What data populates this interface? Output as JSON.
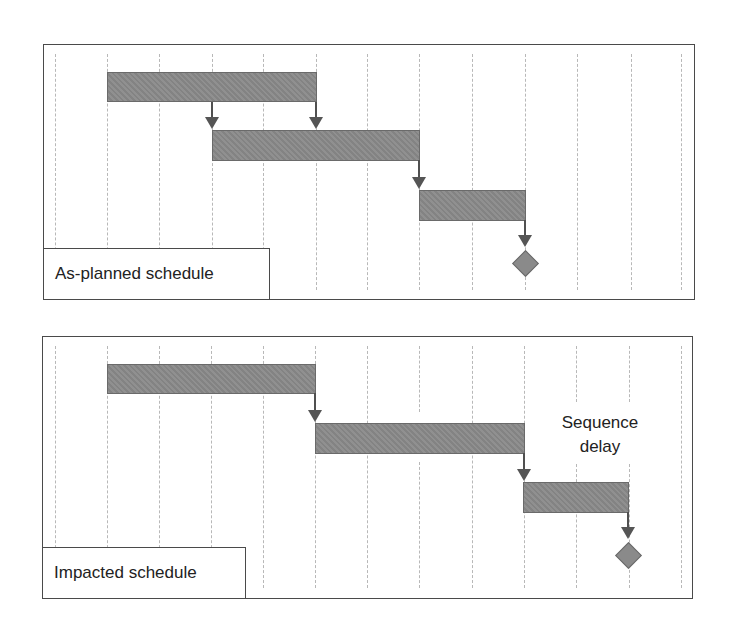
{
  "diagram": {
    "type": "gantt-comparison",
    "colors": {
      "bar_fill": "#8a8a8a",
      "bar_border": "#6a6a6a",
      "arrow": "#555555",
      "gridline": "#b8b8b8",
      "frame": "#4a4a4a"
    },
    "time_columns": 12,
    "panels": [
      {
        "label": "As-planned schedule",
        "tasks": [
          {
            "name": "Task 1",
            "start_col": 1,
            "end_col": 5
          },
          {
            "name": "Task 2",
            "start_col": 3,
            "end_col": 7
          },
          {
            "name": "Task 3",
            "start_col": 7,
            "end_col": 9
          }
        ],
        "milestone_col": 9,
        "dependencies": [
          {
            "from": "Task 1 (mid)",
            "to": "Task 2"
          },
          {
            "from": "Task 1 (end)",
            "to": "Task 2"
          },
          {
            "from": "Task 2",
            "to": "Task 3"
          },
          {
            "from": "Task 3",
            "to": "Milestone"
          }
        ]
      },
      {
        "label": "Impacted schedule",
        "annotation_line1": "Sequence",
        "annotation_line2": "delay",
        "tasks": [
          {
            "name": "Task 1",
            "start_col": 1,
            "end_col": 5
          },
          {
            "name": "Task 2",
            "start_col": 5,
            "end_col": 9
          },
          {
            "name": "Task 3",
            "start_col": 9,
            "end_col": 11
          }
        ],
        "milestone_col": 11,
        "dependencies": [
          {
            "from": "Task 1",
            "to": "Task 2"
          },
          {
            "from": "Task 2",
            "to": "Task 3"
          },
          {
            "from": "Task 3",
            "to": "Milestone"
          }
        ]
      }
    ]
  }
}
